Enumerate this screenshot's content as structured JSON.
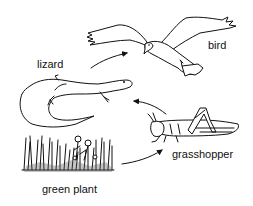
{
  "diagram": {
    "type": "food-chain",
    "organisms": [
      {
        "id": "green_plant",
        "label": "green plant",
        "role": "producer"
      },
      {
        "id": "grasshopper",
        "label": "grasshopper",
        "role": "primary consumer"
      },
      {
        "id": "lizard",
        "label": "lizard",
        "role": "secondary consumer"
      },
      {
        "id": "bird",
        "label": "bird",
        "role": "tertiary consumer"
      }
    ],
    "arrows": [
      {
        "from": "green plant",
        "to": "grasshopper"
      },
      {
        "from": "grasshopper",
        "to": "lizard"
      },
      {
        "from": "lizard",
        "to": "bird"
      }
    ]
  },
  "labels": {
    "bird": "bird",
    "lizard": "lizard",
    "grasshopper": "grasshopper",
    "green_plant": "green plant"
  },
  "colors": {
    "ink": "#111111",
    "background": "#ffffff"
  }
}
